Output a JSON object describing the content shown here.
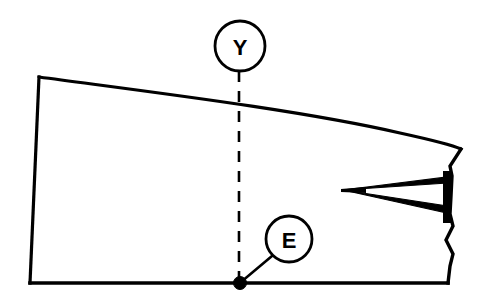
{
  "figure": {
    "type": "technical-line-drawing",
    "background_color": "#ffffff",
    "line_color": "#000000"
  },
  "callouts": [
    {
      "id": "callout-y",
      "label": "Y",
      "shape": "circle",
      "center_x": 240,
      "center_y": 46,
      "radius": 25,
      "leader_style": "dashed",
      "leader_to_x": 239,
      "leader_to_y": 283
    },
    {
      "id": "callout-e",
      "label": "E",
      "shape": "circle",
      "center_x": 289,
      "center_y": 239,
      "radius": 23,
      "leader_style": "solid",
      "leader_to_x": 240,
      "leader_to_y": 283
    }
  ],
  "markers": [
    {
      "id": "datum-point",
      "shape": "filled-dot",
      "x": 240,
      "y": 283,
      "radius": 6
    }
  ],
  "outline": {
    "top_left_x": 39,
    "top_left_y": 77,
    "bottom_left_x": 30,
    "bottom_left_y": 283,
    "bottom_right_x": 448,
    "bottom_right_y": 283,
    "top_right_x": 460,
    "top_right_y": 148,
    "top_edge": "curved",
    "right_edge": "break-line"
  },
  "detail": {
    "id": "wedge-detail",
    "apex_x": 343,
    "apex_y": 190,
    "bar_x": 448,
    "bar_top_y": 172,
    "bar_bottom_y": 222
  }
}
